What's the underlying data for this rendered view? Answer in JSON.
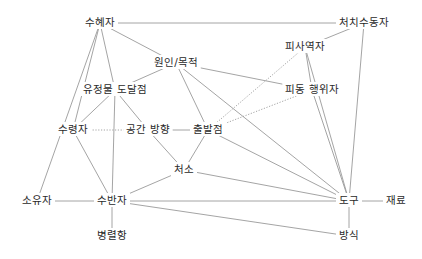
{
  "diagram": {
    "type": "semantic-role-network",
    "nodes": [
      {
        "id": "beneficiary",
        "label": "수혜자",
        "x": 100,
        "y": 23
      },
      {
        "id": "disposal_patient",
        "label": "처치수동자",
        "x": 364,
        "y": 23
      },
      {
        "id": "cause_purpose",
        "label": "원인/목적",
        "x": 176,
        "y": 63
      },
      {
        "id": "causee",
        "label": "피사역자",
        "x": 305,
        "y": 47
      },
      {
        "id": "animate_goal",
        "label": "유정물 도달점",
        "x": 115,
        "y": 90
      },
      {
        "id": "passive_agent",
        "label": "피동 행위자",
        "x": 312,
        "y": 90
      },
      {
        "id": "recipient",
        "label": "수령자",
        "x": 73,
        "y": 130
      },
      {
        "id": "spatial_direction",
        "label": "공간 방향",
        "x": 148,
        "y": 130
      },
      {
        "id": "source",
        "label": "출발점",
        "x": 208,
        "y": 130
      },
      {
        "id": "location",
        "label": "처소",
        "x": 184,
        "y": 170
      },
      {
        "id": "possessor",
        "label": "소유자",
        "x": 37,
        "y": 201
      },
      {
        "id": "comitative",
        "label": "수반자",
        "x": 112,
        "y": 201
      },
      {
        "id": "instrument",
        "label": "도구",
        "x": 349,
        "y": 201
      },
      {
        "id": "material",
        "label": "재료",
        "x": 396,
        "y": 201
      },
      {
        "id": "coordinate",
        "label": "병렬항",
        "x": 112,
        "y": 236
      },
      {
        "id": "manner",
        "label": "방식",
        "x": 349,
        "y": 236
      }
    ],
    "edges": [
      {
        "from": "beneficiary",
        "to": "disposal_patient",
        "style": "solid"
      },
      {
        "from": "beneficiary",
        "to": "cause_purpose",
        "style": "solid"
      },
      {
        "from": "beneficiary",
        "to": "animate_goal",
        "style": "solid"
      },
      {
        "from": "beneficiary",
        "to": "recipient",
        "style": "solid"
      },
      {
        "from": "beneficiary",
        "to": "possessor",
        "style": "solid"
      },
      {
        "from": "cause_purpose",
        "to": "animate_goal",
        "style": "solid"
      },
      {
        "from": "cause_purpose",
        "to": "source",
        "style": "solid"
      },
      {
        "from": "cause_purpose",
        "to": "passive_agent",
        "style": "solid"
      },
      {
        "from": "cause_purpose",
        "to": "instrument",
        "style": "solid"
      },
      {
        "from": "disposal_patient",
        "to": "causee",
        "style": "solid"
      },
      {
        "from": "disposal_patient",
        "to": "instrument",
        "style": "solid"
      },
      {
        "from": "causee",
        "to": "passive_agent",
        "style": "solid"
      },
      {
        "from": "causee",
        "to": "instrument",
        "style": "solid"
      },
      {
        "from": "causee",
        "to": "source",
        "style": "dotted"
      },
      {
        "from": "passive_agent",
        "to": "source",
        "style": "dotted"
      },
      {
        "from": "passive_agent",
        "to": "instrument",
        "style": "solid"
      },
      {
        "from": "animate_goal",
        "to": "recipient",
        "style": "solid"
      },
      {
        "from": "animate_goal",
        "to": "spatial_direction",
        "style": "solid"
      },
      {
        "from": "animate_goal",
        "to": "comitative",
        "style": "solid"
      },
      {
        "from": "recipient",
        "to": "spatial_direction",
        "style": "dotted"
      },
      {
        "from": "recipient",
        "to": "comitative",
        "style": "solid"
      },
      {
        "from": "spatial_direction",
        "to": "source",
        "style": "solid"
      },
      {
        "from": "spatial_direction",
        "to": "location",
        "style": "solid"
      },
      {
        "from": "source",
        "to": "location",
        "style": "solid"
      },
      {
        "from": "source",
        "to": "instrument",
        "style": "solid"
      },
      {
        "from": "location",
        "to": "comitative",
        "style": "solid"
      },
      {
        "from": "location",
        "to": "instrument",
        "style": "solid"
      },
      {
        "from": "possessor",
        "to": "comitative",
        "style": "solid"
      },
      {
        "from": "comitative",
        "to": "instrument",
        "style": "solid"
      },
      {
        "from": "comitative",
        "to": "manner",
        "style": "solid"
      },
      {
        "from": "comitative",
        "to": "coordinate",
        "style": "solid"
      },
      {
        "from": "instrument",
        "to": "material",
        "style": "solid"
      },
      {
        "from": "instrument",
        "to": "manner",
        "style": "solid"
      }
    ]
  },
  "colors": {
    "background": "#ffffff",
    "edge": "#9a9a9a",
    "text": "#2a2a2a"
  }
}
